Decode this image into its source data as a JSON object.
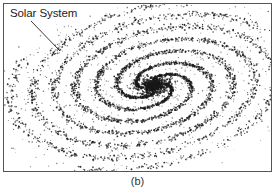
{
  "figure": {
    "label": "Solar System",
    "caption": "(b)",
    "colors": {
      "ink": "#1a1a1a",
      "frame": "#555555",
      "background": "#ffffff"
    }
  }
}
